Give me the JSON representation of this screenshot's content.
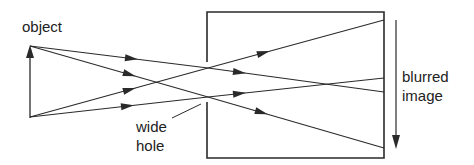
{
  "diagram": {
    "labels": {
      "object": "object",
      "hole_line1": "wide",
      "hole_line2": "hole",
      "image_line1": "blurred",
      "image_line2": "image"
    },
    "colors": {
      "stroke": "#2a2a2a",
      "background": "#ffffff"
    },
    "elements": [
      {
        "id": "object-arrow",
        "type": "arrow",
        "direction": "up"
      },
      {
        "id": "camera-box",
        "type": "box",
        "note": "left wall has a wide opening"
      },
      {
        "id": "light-rays",
        "type": "rays",
        "count": 4
      },
      {
        "id": "image-arrow",
        "type": "arrow",
        "direction": "down"
      }
    ]
  }
}
